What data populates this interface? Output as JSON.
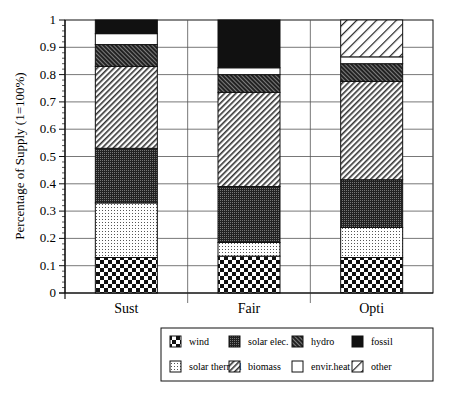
{
  "chart_data": {
    "type": "bar",
    "stacked": true,
    "title": "",
    "xlabel": "",
    "ylabel": "Percentage of Supply (1=100%)",
    "ylim": [
      0,
      1
    ],
    "yticks": [
      "0",
      "0.1",
      "0.2",
      "0.3",
      "0.4",
      "0.5",
      "0.6",
      "0.7",
      "0.8",
      "0.9",
      "1"
    ],
    "grid": true,
    "legend_position": "bottom-right",
    "categories": [
      "Sust",
      "Fair",
      "Opti"
    ],
    "series": [
      {
        "name": "wind",
        "pattern": "checker",
        "values": [
          0.13,
          0.135,
          0.13
        ]
      },
      {
        "name": "solar thermal",
        "pattern": "dots",
        "values": [
          0.2,
          0.05,
          0.11
        ]
      },
      {
        "name": "solar elec.",
        "pattern": "dense-grid",
        "values": [
          0.2,
          0.205,
          0.175
        ]
      },
      {
        "name": "biomass",
        "pattern": "fine-diagonal",
        "values": [
          0.3,
          0.345,
          0.36
        ]
      },
      {
        "name": "hydro",
        "pattern": "dark-diagonal",
        "values": [
          0.08,
          0.065,
          0.065
        ]
      },
      {
        "name": "envir.heat",
        "pattern": "white",
        "values": [
          0.04,
          0.025,
          0.025
        ]
      },
      {
        "name": "fossil",
        "pattern": "black",
        "values": [
          0.05,
          0.175,
          0.0
        ]
      },
      {
        "name": "other",
        "pattern": "wide-diagonal",
        "values": [
          0.0,
          0.0,
          0.135
        ]
      }
    ],
    "legend": {
      "rows": [
        [
          "wind",
          "solar elec.",
          "hydro",
          "fossil"
        ],
        [
          "solar thermal",
          "biomass",
          "envir.heat",
          "other"
        ]
      ]
    }
  },
  "colors": {
    "ink": "#111111",
    "grid": "#555555",
    "background": "#ffffff"
  }
}
